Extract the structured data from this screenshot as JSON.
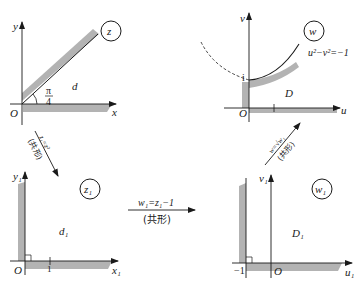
{
  "diagram": {
    "panels": [
      {
        "id": "z",
        "plane_label": "z",
        "axes": {
          "x": "x",
          "y": "y"
        },
        "origin": "O",
        "region": "d",
        "angle_label": {
          "num": "π",
          "den": "4"
        },
        "description": "Sector 0 < arg z < π/4"
      },
      {
        "id": "w",
        "plane_label": "w",
        "axes": {
          "x": "u",
          "y": "v"
        },
        "origin": "O",
        "region": "D",
        "tick_i": "i",
        "tick_1": "1",
        "curve_label": "u²−v²=−1",
        "description": "Region between u-axis and upper hyperbola branch"
      },
      {
        "id": "z1",
        "plane_label": "z₁",
        "axes": {
          "x": "x₁",
          "y": "y₁"
        },
        "origin": "O",
        "region": "d₁",
        "tick_1": "1",
        "description": "First quadrant"
      },
      {
        "id": "w1",
        "plane_label": "w₁",
        "axes": {
          "x": "u₁",
          "y": "v₁"
        },
        "origin": "O",
        "region": "D₁",
        "tick_neg1": "−1",
        "description": "Shifted quadrant Re w₁ > −1, Im w₁ > 0"
      }
    ],
    "arrows": [
      {
        "from": "z",
        "to": "z1",
        "formula": "z₁=z²",
        "note": "(共形)"
      },
      {
        "from": "z1",
        "to": "w1",
        "formula": "w₁=z₁−1",
        "note": "(共形)"
      },
      {
        "from": "w1",
        "to": "w",
        "formula": "w=√w₁",
        "note": "(共形)"
      }
    ],
    "colors": {
      "shade": "#b3b3b3",
      "line": "#1a1a1a"
    }
  }
}
